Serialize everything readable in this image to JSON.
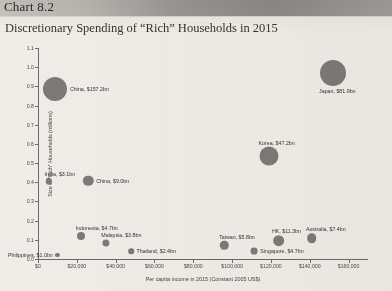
{
  "header": {
    "chart_number": "Chart 8.2",
    "subtitle": "Discretionary Spending of “Rich” Households in 2015"
  },
  "chart_data": {
    "type": "scatter",
    "title": "Discretionary Spending of “Rich” Households in 2015",
    "xlabel": "Per capita income in 2015 (Constant 2005 US$)",
    "ylabel": "Size of “Rich” Households (millions)",
    "xlim": [
      0,
      170000
    ],
    "ylim": [
      0,
      1.1
    ],
    "grid": false,
    "legend": "none",
    "bubble_color": "#7c7a77",
    "xticks": [
      0,
      20000,
      40000,
      60000,
      80000,
      100000,
      120000,
      140000,
      160000
    ],
    "xtick_labels": [
      "$0",
      "$20,000",
      "$40,000",
      "$60,000",
      "$80,000",
      "$100,000",
      "$120,000",
      "$140,000",
      "$160,000"
    ],
    "yticks": [
      0.0,
      0.1,
      0.2,
      0.3,
      0.4,
      0.5,
      0.6,
      0.7,
      0.8,
      0.9,
      1.0,
      1.1
    ],
    "ytick_labels": [
      "0.0",
      "0.1",
      "0.2",
      "0.3",
      "0.4",
      "0.5",
      "0.6",
      "0.7",
      "0.8",
      "0.9",
      "1.0",
      "1.1"
    ],
    "points": [
      {
        "name": "China",
        "label": "China, $157.2bn",
        "x": 9000,
        "y": 0.885,
        "size": 157.2,
        "r": 12.0,
        "label_side": "right"
      },
      {
        "name": "India",
        "label": "India, $3.1bn",
        "x": 5500,
        "y": 0.405,
        "size": 3.1,
        "r": 3.2,
        "label_side": "above"
      },
      {
        "name": "China2",
        "label": "China, $9.0bn",
        "x": 26000,
        "y": 0.408,
        "size": 9.0,
        "r": 5.2,
        "label_side": "right"
      },
      {
        "name": "Indonesia",
        "label": "Indonesia, $4.7bn",
        "x": 22000,
        "y": 0.118,
        "size": 4.7,
        "r": 4.0,
        "label_side": "above"
      },
      {
        "name": "Malaysia",
        "label": "Malaysia, $3.8bn",
        "x": 35000,
        "y": 0.085,
        "size": 3.8,
        "r": 3.6,
        "label_side": "above"
      },
      {
        "name": "Philippines",
        "label": "Philippines, $1.0bn",
        "x": 10000,
        "y": 0.022,
        "size": 1.0,
        "r": 2.1,
        "label_side": "left"
      },
      {
        "name": "Thailand",
        "label": "Thailand, $2.4bn",
        "x": 48000,
        "y": 0.04,
        "size": 2.4,
        "r": 2.8,
        "label_side": "right"
      },
      {
        "name": "Taiwan",
        "label": "Taiwan, $5.8bn",
        "x": 96000,
        "y": 0.072,
        "size": 5.8,
        "r": 4.2,
        "label_side": "above"
      },
      {
        "name": "HK",
        "label": "HK, $11.3bn",
        "x": 124000,
        "y": 0.095,
        "size": 11.3,
        "r": 5.8,
        "label_side": "above"
      },
      {
        "name": "Singapore",
        "label": "Singapore, $4.7bn",
        "x": 111500,
        "y": 0.042,
        "size": 4.7,
        "r": 3.4,
        "label_side": "right"
      },
      {
        "name": "Australia",
        "label": "Australia, $7.4bn",
        "x": 141000,
        "y": 0.108,
        "size": 7.4,
        "r": 4.8,
        "label_side": "above"
      },
      {
        "name": "Korea",
        "label": "Korea, $47.2bn",
        "x": 119000,
        "y": 0.535,
        "size": 47.2,
        "r": 9.5,
        "label_side": "above"
      },
      {
        "name": "Japan",
        "label": "Japan, $81.9bn",
        "x": 152000,
        "y": 0.97,
        "size": 81.9,
        "r": 13.0,
        "label_side": "below"
      }
    ]
  }
}
